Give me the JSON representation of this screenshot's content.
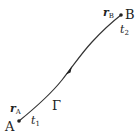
{
  "diagram": {
    "curve_label": "Γ",
    "start_point": {
      "name": "A",
      "position_label": "r",
      "position_sub": "A",
      "param_label": "t",
      "param_sub": "1"
    },
    "end_point": {
      "name": "B",
      "position_label": "r",
      "position_sub": "B",
      "param_label": "t",
      "param_sub": "2"
    },
    "colors": {
      "stroke": "#333333",
      "text": "#222222",
      "background": "#ffffff"
    }
  }
}
